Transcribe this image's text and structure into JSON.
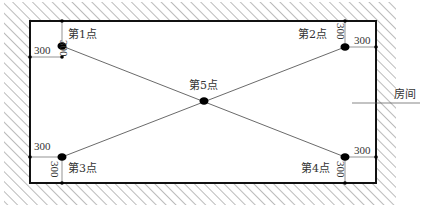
{
  "diagram": {
    "type": "room-measurement-point-layout",
    "room_label": "房间",
    "points": [
      {
        "id": 1,
        "label": "第1点",
        "x": 62,
        "y": 46
      },
      {
        "id": 2,
        "label": "第2点",
        "x": 345,
        "y": 47
      },
      {
        "id": 3,
        "label": "第3点",
        "x": 62,
        "y": 157
      },
      {
        "id": 4,
        "label": "第4点",
        "x": 345,
        "y": 157
      },
      {
        "id": 5,
        "label": "第5点",
        "x": 204,
        "y": 101
      }
    ],
    "dimensions": {
      "p1_top": "300",
      "p1_left": "300",
      "p2_top": "300",
      "p2_right": "300",
      "p3_left": "300",
      "p3_bottom": "300",
      "p4_right": "300",
      "p4_bottom": "300"
    },
    "colors": {
      "wall_line": "#111111",
      "hatch": "#555555",
      "diagonal": "#444444",
      "point": "#000000",
      "dimension_line": "#666666"
    }
  }
}
